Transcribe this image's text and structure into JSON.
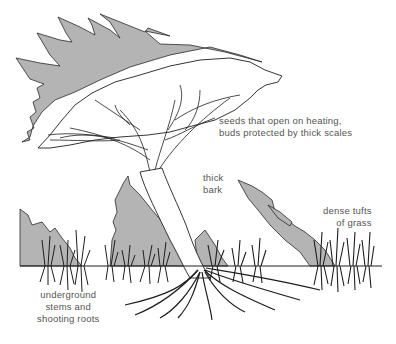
{
  "figure": {
    "colors": {
      "flame_fill": "#b4b4b4",
      "line": "#1e1e1e",
      "label_text": "#555555",
      "background": "#ffffff"
    }
  },
  "labels": {
    "seeds": {
      "line1": "seeds that open on heating,",
      "line2": "buds protected by thick scales"
    },
    "bark": {
      "line1": "thick",
      "line2": "bark"
    },
    "grass": {
      "line1": "dense tufts",
      "line2": "of grass"
    },
    "underground": {
      "line1": "underground",
      "line2": "stems and",
      "line3": "shooting roots"
    }
  }
}
